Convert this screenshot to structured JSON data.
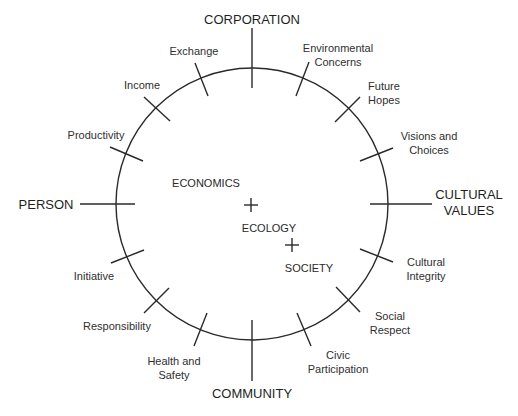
{
  "diagram": {
    "axes": {
      "top": "CORPORATION",
      "bottom": "COMMUNITY",
      "left": "PERSON",
      "right": "CULTURAL\nVALUES"
    },
    "center_labels": {
      "economics": "ECONOMICS",
      "ecology": "ECOLOGY",
      "society": "SOCIETY"
    },
    "ticks": {
      "exchange": "Exchange",
      "income": "Income",
      "productivity": "Productivity",
      "environmental_concerns": "Environmental\nConcerns",
      "future_hopes": "Future\nHopes",
      "visions_and_choices": "Visions and\nChoices",
      "cultural_integrity": "Cultural\nIntegrity",
      "social_respect": "Social\nRespect",
      "civic_participation": "Civic\nParticipation",
      "health_and_safety": "Health and\nSafety",
      "responsibility": "Responsibility",
      "initiative": "Initiative"
    },
    "colors": {
      "line": "#2a2a2a",
      "background": "#ffffff"
    }
  }
}
